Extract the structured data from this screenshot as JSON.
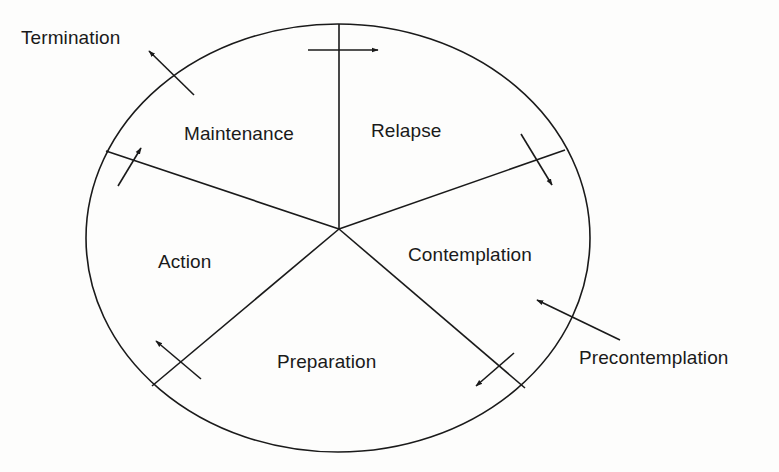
{
  "diagram": {
    "colors": {
      "background": "#fdfdfc",
      "ink": "#1a1a1a"
    },
    "stages_inside_cycle": [
      {
        "id": "maintenance",
        "label": "Maintenance"
      },
      {
        "id": "relapse",
        "label": "Relapse"
      },
      {
        "id": "contemplation",
        "label": "Contemplation"
      },
      {
        "id": "preparation",
        "label": "Preparation"
      },
      {
        "id": "action",
        "label": "Action"
      }
    ],
    "external_stages": {
      "entry": {
        "id": "precontemplation",
        "label": "Precontemplation"
      },
      "exit": {
        "id": "termination",
        "label": "Termination"
      }
    },
    "flow": [
      {
        "from": "Maintenance",
        "to": "Relapse"
      },
      {
        "from": "Relapse",
        "to": "Contemplation"
      },
      {
        "from": "Contemplation",
        "to": "Preparation"
      },
      {
        "from": "Preparation",
        "to": "Action"
      },
      {
        "from": "Action",
        "to": "Maintenance"
      },
      {
        "from": "Maintenance",
        "to": "Termination"
      },
      {
        "from": "Precontemplation",
        "to": "Contemplation"
      }
    ]
  }
}
